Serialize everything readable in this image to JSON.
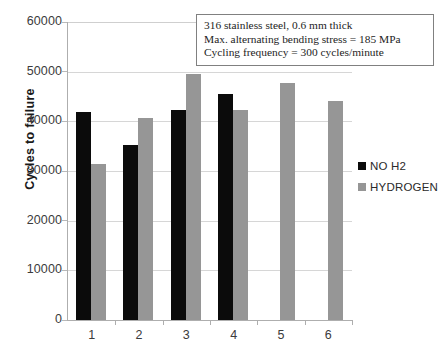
{
  "chart_data": {
    "type": "bar",
    "title": "",
    "xlabel": "",
    "ylabel": "Cycles to failure",
    "ylim": [
      0,
      60000
    ],
    "ytick_values": [
      60000,
      50000,
      40000,
      30000,
      20000,
      10000,
      0
    ],
    "ytick_labels": [
      "60000",
      "50000",
      "40000",
      "30000",
      "20000",
      "10000",
      "0"
    ],
    "grid": true,
    "legend_position": "right",
    "categories": [
      "1",
      "2",
      "3",
      "4",
      "5",
      "6"
    ],
    "series": [
      {
        "name": "NO H2",
        "color": "#0b0b0b",
        "values": [
          41800,
          35200,
          42200,
          45600,
          null,
          null
        ]
      },
      {
        "name": "HYDROGEN",
        "color": "#969696",
        "values": [
          31400,
          40700,
          49500,
          42200,
          47700,
          44100
        ]
      }
    ],
    "annotations": [
      "316 stainless steel, 0.6 mm thick",
      "Max. alternating bending stress = 185 MPa",
      "Cycling frequency = 300 cycles/minute"
    ]
  }
}
